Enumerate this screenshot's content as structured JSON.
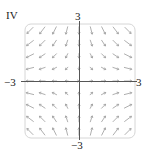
{
  "panel": {
    "label": "IV",
    "x_min_label": "−3",
    "x_max_label": "3",
    "y_min_label": "−3",
    "y_max_label": "3"
  },
  "plot": {
    "type": "vector-field",
    "frame": {
      "x": 25,
      "y": 24,
      "width": 110,
      "height": 114,
      "radius": 6
    },
    "origin_px": {
      "x": 79,
      "y": 81
    },
    "range": {
      "x": [
        -3,
        3
      ],
      "y": [
        -3,
        3
      ]
    },
    "grid_n": 9,
    "field": "F(x, y) = (x, -y)",
    "colors": {
      "frame": "#d6d6d6",
      "axis": "#555555",
      "arrow": "#9a9a9a"
    }
  }
}
